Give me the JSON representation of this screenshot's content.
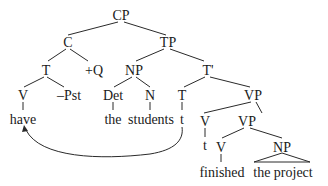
{
  "diagram": {
    "type": "syntax-tree",
    "nodes": {
      "cp": "CP",
      "c": "C",
      "tp": "TP",
      "c_t": "T",
      "q": "+Q",
      "np_subj": "NP",
      "t_bar": "T'",
      "c_v": "V",
      "pst": "–Pst",
      "det": "Det",
      "n": "N",
      "t_head": "T",
      "vp1": "VP",
      "have": "have",
      "the": "the",
      "students": "students",
      "t_trace": "t",
      "vp1_v": "V",
      "vp2": "VP",
      "v_trace": "t",
      "vp2_v": "V",
      "np_obj": "NP",
      "finished": "finished",
      "the_project": "the project"
    },
    "movement_arrow": {
      "from": "t",
      "to": "have"
    }
  }
}
